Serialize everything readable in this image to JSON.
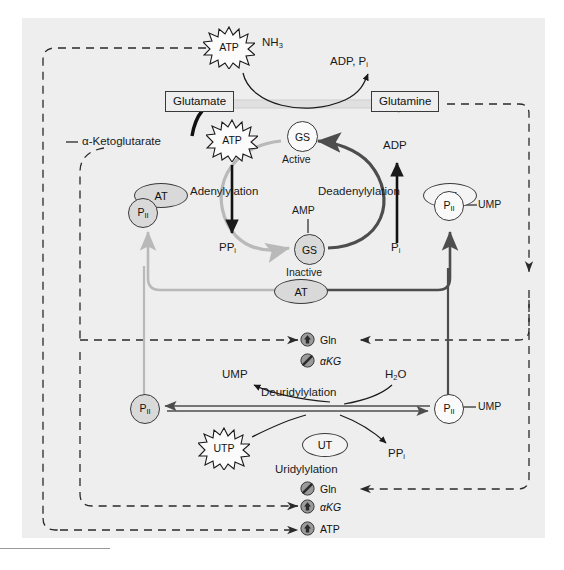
{
  "figure": {
    "panel_bg": "#eeeeee",
    "colors": {
      "dark_line": "#4d4d4d",
      "light_line": "#b9b9b9",
      "black": "#1a1a1a",
      "fill_gray": "#d9d9d9"
    }
  },
  "metabolites": {
    "alpha_ketoglutarate": "α-Ketoglutarate",
    "glutamate": "Glutamate",
    "glutamine": "Glutamine",
    "nh3": "NH",
    "nh3_sub": "3",
    "adp_pi": "ADP, P",
    "adp_pi_sub": "i",
    "adp": "ADP",
    "pi": "P",
    "pi_sub": "i",
    "ppi": "PP",
    "ppi_sub": "i",
    "amp": "AMP",
    "ump": "UMP",
    "h2o": "H",
    "h2o_sub": "2",
    "h2o_tail": "O"
  },
  "energy_stars": [
    {
      "label": "ATP",
      "name": "atp-star-top"
    },
    {
      "label": "ATP",
      "name": "atp-star-adenylylation"
    },
    {
      "label": "UTP",
      "name": "utp-star-uridylylation"
    }
  ],
  "enzymes": {
    "gs_active": {
      "tag": "GS",
      "state": "Active"
    },
    "gs_inactive": {
      "tag": "GS",
      "state": "Inactive"
    },
    "at": "AT",
    "ut": "UT",
    "pii": "P",
    "pii_sub": "II",
    "ump_tag": "UMP"
  },
  "reactions": {
    "adenylylation": "Adenylylation",
    "deadenylylation": "Deadenylylation",
    "uridylylation": "Uridylylation",
    "deuridylylation": "Deuridylylation"
  },
  "modulators": {
    "group_upper": [
      {
        "label": "Gln",
        "effect": "activate",
        "icon": "up-arrow-circle-icon"
      },
      {
        "label": "αKG",
        "effect": "inhibit",
        "icon": "slash-circle-icon"
      }
    ],
    "group_lower": [
      {
        "label": "Gln",
        "effect": "inhibit",
        "icon": "slash-circle-icon"
      },
      {
        "label": "αKG",
        "effect": "activate",
        "icon": "up-arrow-circle-icon"
      },
      {
        "label": "ATP",
        "effect": "activate",
        "icon": "up-arrow-circle-icon"
      }
    ]
  }
}
